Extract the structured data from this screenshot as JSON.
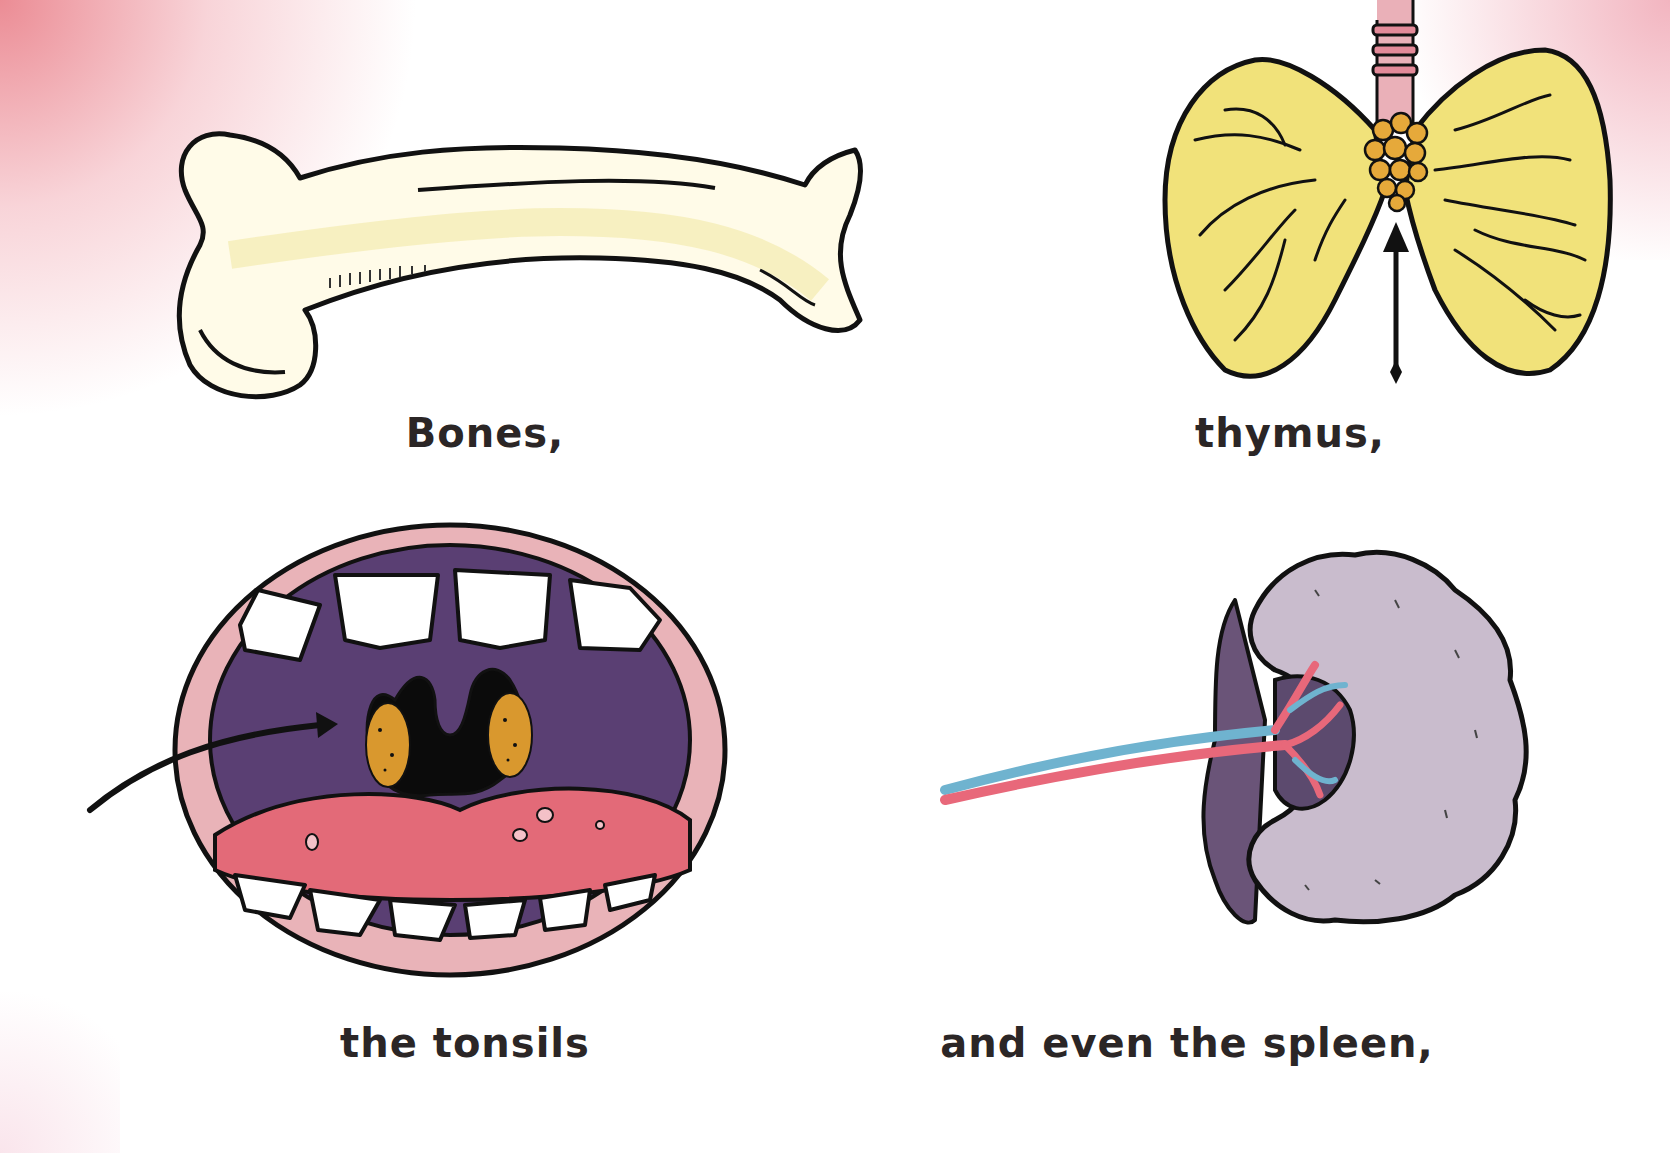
{
  "page": {
    "background_color": "#ffffff",
    "accent_corner_color": "#e8808a"
  },
  "panels": [
    {
      "id": "bones",
      "caption": "Bones,",
      "illustration": "bone-icon"
    },
    {
      "id": "thymus",
      "caption": "thymus,",
      "illustration": "thymus-icon"
    },
    {
      "id": "tonsils",
      "caption": "the tonsils",
      "illustration": "open-mouth-tonsils-icon"
    },
    {
      "id": "spleen",
      "caption": "and even the spleen,",
      "illustration": "spleen-icon"
    }
  ],
  "colors": {
    "outline": "#111111",
    "bone_fill": "#fffbe6",
    "bone_shade": "#f3eba0",
    "thymus_lobe": "#f1e27a",
    "thymus_gland": "#e6a93a",
    "trachea": "#eaa8b2",
    "lip": "#e9b3b8",
    "mouth_interior": "#5a3f73",
    "tongue": "#e36a78",
    "tonsil": "#d9982e",
    "spleen_light": "#c9bccd",
    "spleen_dark": "#6a5478",
    "artery": "#e8687a",
    "vein": "#6fb3cf"
  }
}
